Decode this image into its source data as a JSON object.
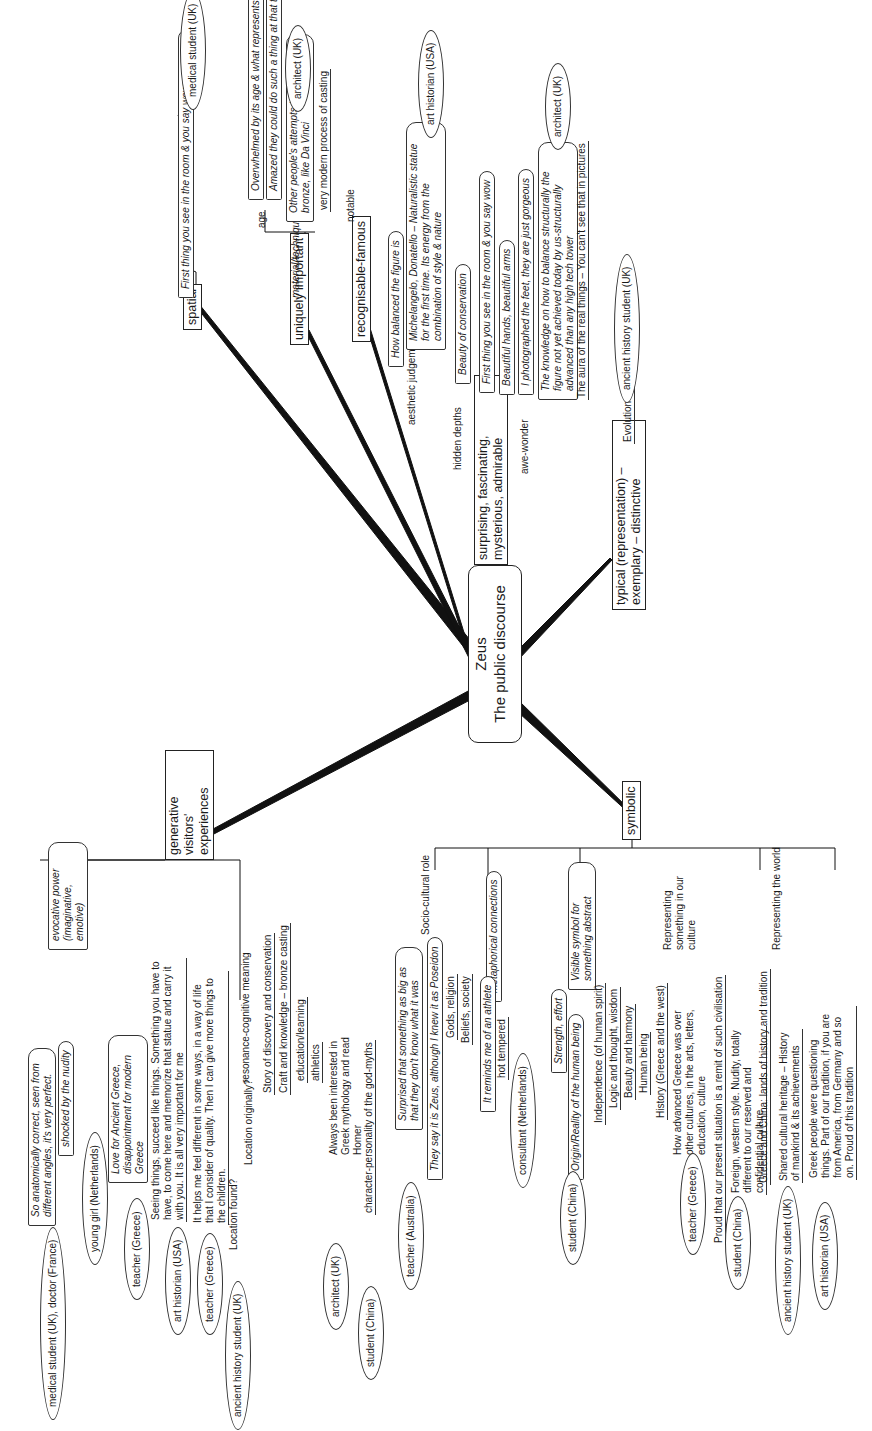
{
  "center": {
    "line1": "Zeus",
    "line2": "The public discourse"
  },
  "branches": {
    "spatial": {
      "label": "spatial",
      "quote": "First thing you see in the room & you say wow",
      "speaker": "medical student (UK)"
    },
    "uniquely_important": {
      "label": "uniquely important",
      "age": {
        "label": "age",
        "quotes": [
          "Overwhelmed by its age & what represents",
          "Amazed they could do such a thing at that time"
        ]
      },
      "material": {
        "label": "material/technique",
        "quotes": [
          "Other people's attempts to casting bronze, like Da Vinci",
          "very modern process of casting"
        ],
        "speaker": "architect (UK)"
      }
    },
    "recognisable": {
      "label": "recognisable-famous",
      "sub": "notable"
    },
    "surprising": {
      "label": "surprising, fascinating, mysterious, admirable",
      "aesthetic": {
        "label": "aesthetic judgement",
        "quotes": [
          "How balanced the figure is",
          "Michelangelo, Donatello – Naturalistic statue for the first time. Its energy from the combination of style & nature"
        ],
        "speaker": "art historian (USA)"
      },
      "hidden": {
        "label": "hidden depths",
        "quotes": [
          "Beauty of conservation"
        ]
      },
      "awe": {
        "label": "awe-wonder",
        "quotes": [
          "First thing you see in the room & you say wow",
          "Beautiful hands, beautiful arms",
          "I photographed the feet, they are just gorgeous",
          "The knowledge on how to balance structurally the figure not yet achieved today by us-structurally advanced than any high tech tower",
          "The aura of the real things – You can't  see that in pictures"
        ],
        "speaker": "architect (UK)"
      }
    },
    "typical": {
      "label": "typical (representation) – exemplary – distinctive",
      "sub": "Evolution of art",
      "speaker": "ancient history student (UK)"
    },
    "generative": {
      "label": "generative visitors' experiences",
      "evocative": {
        "label": "evocative power (imaginative, emotive)",
        "quotes": [
          {
            "text": "So anatomically correct, seen from different angles, it's very perfect.",
            "speaker": "medical student (UK), doctor (France)"
          },
          {
            "text": "shocked by the nudity",
            "speaker": "young girl (Netherlands)"
          },
          {
            "text": "Love for Ancient Greece, disappointment for modern Greece",
            "speaker": "teacher (Greece)"
          }
        ]
      },
      "statements": [
        {
          "text": "Seeing things, succeed like things. Something you have to have, to come here and memorize that statue and carry it with you. It is all very important for me",
          "speaker": "art historian (USA)"
        },
        {
          "text": "It helps me feel different in some ways, in a way of life that I consider of quality. Then I can give more things to the children.",
          "speaker": "teacher (Greece)"
        }
      ],
      "resonance": {
        "label": "resonance-cognitive meaning",
        "items": [
          "Location found?",
          "Location originally?",
          "Story of discovery and conservation",
          "Craft and knowledge – bronze casting",
          "education/learning",
          "athletics",
          "Always been interested in Greek mythology and read Homer",
          "character-personality of the god-myths"
        ],
        "speakers": [
          "ancient history student (UK)",
          "architect (UK)",
          "student (China)"
        ]
      }
    },
    "symbolic": {
      "label": "symbolic",
      "socio": {
        "label": "Socio-cultural role",
        "items": [
          "Surprised that something as big as that they don't know what it was",
          "They say it is Zeus, although I knew it as Poseidon",
          "Gods, religion",
          "Beliefs, society"
        ],
        "speaker": "teacher (Australia)"
      },
      "metaphor": {
        "label": "metaphorical connections",
        "items": [
          "It reminds me of an athlete",
          "hot tempered"
        ]
      },
      "visible": {
        "label": "Visible symbol for something abstract",
        "items": [
          "Strength, effort",
          "Origin/Reality of the human being",
          "Independence (of human spirit)",
          "Logic and thought, wisdom",
          "Beauty and harmony",
          "Human being"
        ],
        "speakers": [
          "consultant (Netherlands)",
          "student (China)"
        ]
      },
      "culture": {
        "label": "Representing something in our culture",
        "items": [
          "History (Greece and the west)",
          "How advanced Greece was over other cultures, in the arts, letters, education, culture"
        ],
        "speaker": "teacher (Greece)"
      },
      "world": {
        "label": "Representing the world",
        "items": [
          "Proud that our present situation is a remit of such civilisation",
          "Foreign, western style. Nudity, totally different to our reserved and confidential culture",
          "Greece and China: lands of history and tradition",
          "Shared cultural heritage – History of mankind & its achievements",
          "Greek people were questioning things. Part of our tradition, if you are from America, from Germany and so on. Proud of this tradition"
        ],
        "speakers": [
          "student (China)",
          "ancient history student (UK)",
          "art historian (USA)"
        ]
      }
    }
  }
}
